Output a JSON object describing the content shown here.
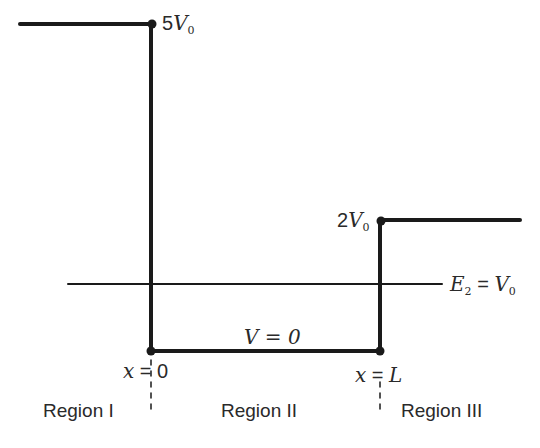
{
  "diagram": {
    "type": "finite potential step/well",
    "potential_levels": {
      "left_barrier": {
        "coef": "5",
        "sym": "V",
        "sub": "0"
      },
      "right_step": {
        "coef": "2",
        "sym": "V",
        "sub": "0"
      },
      "well": {
        "text": "V = 0"
      }
    },
    "energy_line": {
      "E": "E",
      "E_sub": "2",
      "eq": " = ",
      "V": "V",
      "V_sub": "0"
    },
    "boundaries": [
      {
        "var": "x",
        "eq": " = ",
        "val": "0"
      },
      {
        "var": "x",
        "eq": " = ",
        "val": "L"
      }
    ],
    "regions": [
      "Region I",
      "Region II",
      "Region III"
    ],
    "colors": {
      "line": "#1a1a1a",
      "text": "#2a2a2a",
      "background": "#ffffff"
    }
  }
}
